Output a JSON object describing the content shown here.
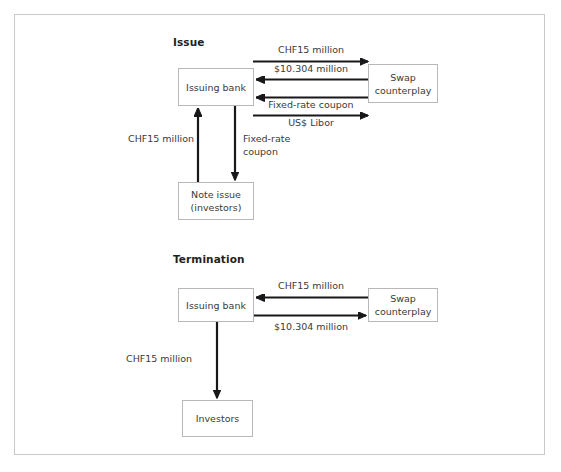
{
  "figure": {
    "border_color": "#c9c9c9",
    "arrow_color": "#18181a",
    "box_border_color": "#b8b8b8",
    "text_color": "#3a3a3a"
  },
  "sections": [
    {
      "id": "issue",
      "heading": "Issue",
      "nodes": [
        {
          "id": "issue-issuing-bank",
          "lines": [
            "Issuing bank"
          ]
        },
        {
          "id": "issue-swap-counterplay",
          "lines": [
            "Swap",
            "counterplay"
          ]
        },
        {
          "id": "issue-note-issue",
          "lines": [
            "Note issue",
            "(investors)"
          ]
        }
      ],
      "flows": [
        {
          "id": "issue-chf15-to-swap",
          "label": "CHF15 million",
          "direction": "right",
          "from": "issue-issuing-bank",
          "to": "issue-swap-counterplay"
        },
        {
          "id": "issue-usd10304-to-bank",
          "label": "$10.304 million",
          "direction": "left",
          "from": "issue-swap-counterplay",
          "to": "issue-issuing-bank"
        },
        {
          "id": "issue-fixed-rate-coupon-to-bank",
          "label": "Fixed-rate coupon",
          "direction": "left",
          "from": "issue-swap-counterplay",
          "to": "issue-issuing-bank"
        },
        {
          "id": "issue-usd-libor-to-swap",
          "label": "US$ Libor",
          "direction": "right",
          "from": "issue-issuing-bank",
          "to": "issue-swap-counterplay"
        },
        {
          "id": "issue-chf15-from-investors",
          "label": "CHF15 million",
          "direction": "up",
          "from": "issue-note-issue",
          "to": "issue-issuing-bank"
        },
        {
          "id": "issue-fixed-rate-coupon-to-investors",
          "label_line1": "Fixed-rate",
          "label_line2": "coupon",
          "direction": "down",
          "from": "issue-issuing-bank",
          "to": "issue-note-issue"
        }
      ]
    },
    {
      "id": "termination",
      "heading": "Termination",
      "nodes": [
        {
          "id": "termination-issuing-bank",
          "lines": [
            "Issuing bank"
          ]
        },
        {
          "id": "termination-swap-counterplay",
          "lines": [
            "Swap",
            "counterplay"
          ]
        },
        {
          "id": "termination-investors",
          "lines": [
            "Investors"
          ]
        }
      ],
      "flows": [
        {
          "id": "termination-chf15-to-bank",
          "label": "CHF15 million",
          "direction": "left",
          "from": "termination-swap-counterplay",
          "to": "termination-issuing-bank"
        },
        {
          "id": "termination-usd10304-to-swap",
          "label": "$10.304 million",
          "direction": "right",
          "from": "termination-issuing-bank",
          "to": "termination-swap-counterplay"
        },
        {
          "id": "termination-chf15-to-investors",
          "label": "CHF15 million",
          "direction": "down",
          "from": "termination-issuing-bank",
          "to": "termination-investors"
        }
      ]
    }
  ],
  "labels": {
    "issue_heading": "Issue",
    "termination_heading": "Termination",
    "issuing_bank": "Issuing bank",
    "swap_line1": "Swap",
    "swap_line2": "counterplay",
    "note_issue_line1": "Note issue",
    "note_issue_line2": "(investors)",
    "investors": "Investors",
    "chf15_million": "CHF15 million",
    "usd_10304_million": "$10.304 million",
    "fixed_rate_coupon": "Fixed-rate coupon",
    "fixed_rate": "Fixed-rate",
    "coupon": "coupon",
    "usd_libor": "US$ Libor"
  }
}
